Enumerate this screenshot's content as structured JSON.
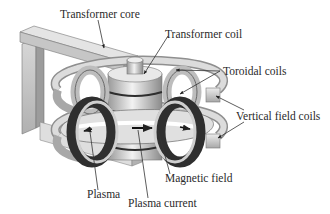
{
  "diagram": {
    "labels": {
      "transformer_core": "Transformer core",
      "transformer_coil": "Transformer coil",
      "toroidal_coils": "Toroidal coils",
      "vertical_field_coils": "Vertical field coils",
      "magnetic_field": "Magnetic field",
      "plasma": "Plasma",
      "plasma_current": "Plasma current"
    },
    "colors": {
      "background": "#ffffff",
      "text": "#2a2a2a",
      "coil_dark": "#3a3a3a",
      "metal_light": "#e6e6e6",
      "metal_mid": "#b4b4b4",
      "leader_line": "#333333"
    }
  }
}
